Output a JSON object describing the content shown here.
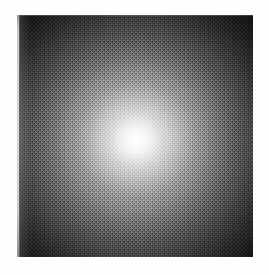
{
  "page": {
    "background_color": "#fefefe",
    "width": 269,
    "height": 275,
    "caption": ""
  },
  "plate": {
    "name": "grayscale-glow-plate",
    "left": 17,
    "top": 15,
    "width": 236,
    "height": 242,
    "background_color": "#171717",
    "border_color": "#d8d8d8",
    "description": "Diffuse elliptical grayscale glow on a dark field, printed with a fine halftone dither screen"
  },
  "image_content": {
    "subject": "diffuse elliptical glow",
    "core_label": "bright nucleus",
    "core_position_pct": {
      "x": 50.8,
      "y": 51.8
    },
    "core_color": "#ffffff",
    "field_color": "#171717",
    "corner_color": "#111111",
    "midedge_color": "#555555",
    "texture": "halftone-dither",
    "rendering": "grayscale"
  },
  "overlays": {
    "left_rule_label": "plate-left-edge-rule",
    "top_rule_label": "plate-top-edge-rule",
    "vignette_label": "corner-vignette",
    "halftone_label": "halftone-screen"
  }
}
